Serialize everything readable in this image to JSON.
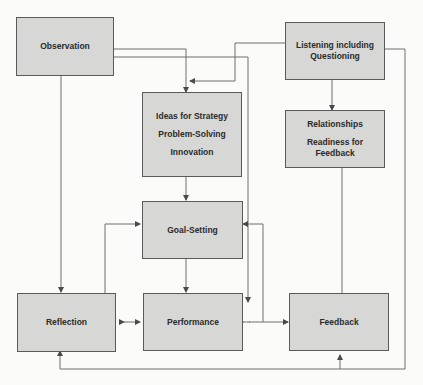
{
  "diagram": {
    "nodes": [
      {
        "id": "observation",
        "lines": [
          "Observation"
        ]
      },
      {
        "id": "listening",
        "lines": [
          "Listening including",
          "Questioning"
        ]
      },
      {
        "id": "ideas",
        "lines": [
          "Ideas for Strategy",
          "Problem-Solving",
          "Innovation"
        ]
      },
      {
        "id": "relationships",
        "lines": [
          "Relationships",
          "Readiness for",
          "Feedback"
        ]
      },
      {
        "id": "goal_setting",
        "lines": [
          "Goal-Setting"
        ]
      },
      {
        "id": "reflection",
        "lines": [
          "Reflection"
        ]
      },
      {
        "id": "performance",
        "lines": [
          "Performance"
        ]
      },
      {
        "id": "feedback",
        "lines": [
          "Feedback"
        ]
      }
    ],
    "edges": [
      {
        "from": "Observation",
        "to": "Ideas for Strategy"
      },
      {
        "from": "Observation",
        "to": "Feedback"
      },
      {
        "from": "Observation",
        "to": "Reflection"
      },
      {
        "from": "Listening including Questioning",
        "to": "Ideas for Strategy"
      },
      {
        "from": "Listening including Questioning",
        "to": "Relationships"
      },
      {
        "from": "Listening including Questioning",
        "to": "Feedback"
      },
      {
        "from": "Listening including Questioning",
        "to": "Reflection"
      },
      {
        "from": "Ideas for Strategy",
        "to": "Goal-Setting"
      },
      {
        "from": "Relationships",
        "to": "Performance/Feedback"
      },
      {
        "from": "Goal-Setting",
        "to": "Performance"
      },
      {
        "from": "Reflection",
        "to": "Goal-Setting"
      },
      {
        "from": "Feedback",
        "to": "Goal-Setting"
      },
      {
        "from": "Reflection",
        "to": "Performance",
        "bidirectional": true
      },
      {
        "from": "Performance",
        "to": "Feedback",
        "bidirectional": true
      }
    ],
    "colors": {
      "box_fill": "#d7d7d5",
      "box_border": "#5a5a5a",
      "line": "#6a6a6a",
      "text": "#2b2b2b"
    }
  }
}
